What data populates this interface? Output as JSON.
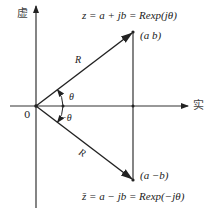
{
  "diagram": {
    "axes": {
      "imag_label": "虚",
      "real_label": "实",
      "origin_label": "0"
    },
    "vectors": [
      {
        "name": "z",
        "magnitude_label": "R",
        "angle_label": "θ",
        "point_label": "(a  b)",
        "equation": "z = a + jb = Rexp(jθ)"
      },
      {
        "name": "z-bar",
        "magnitude_label": "R",
        "angle_label": "−θ",
        "point_label": "(a  −b)",
        "equation": "z̄ = a − jb = Rexp(−jθ)"
      }
    ],
    "colors": {
      "line": "#222222",
      "text": "#222222"
    }
  }
}
